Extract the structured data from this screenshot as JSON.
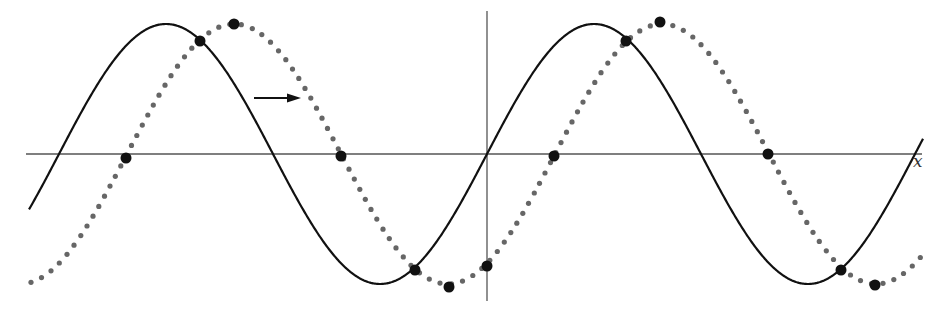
{
  "diagram": {
    "title": "",
    "x_axis_label": "x",
    "colors": {
      "solid_curve": "#111111",
      "dotted_curve": "#666666",
      "marker": "#111111",
      "axis": "#555555",
      "arrow": "#111111"
    },
    "geometry": {
      "origin": [
        487,
        154
      ],
      "amplitude_px": 130,
      "period_px": 428,
      "shift_px": 68,
      "x_axis": {
        "x1": 26,
        "x2": 922,
        "y": 154
      },
      "y_axis": {
        "x": 487,
        "y1": 11,
        "y2": 301
      },
      "solid_range": [
        29,
        923
      ],
      "dotted_range": [
        31,
        922
      ],
      "arrow": {
        "x1": 254,
        "x2": 301,
        "y": 98,
        "direction": "right"
      }
    },
    "curves": [
      {
        "name": "original-wave",
        "style": "solid",
        "equation": "y = sin(x)"
      },
      {
        "name": "shifted-wave",
        "style": "dotted",
        "equation": "y = sin(x - c)"
      }
    ],
    "markers": [
      [
        126,
        158
      ],
      [
        200,
        41
      ],
      [
        234,
        24
      ],
      [
        341,
        156
      ],
      [
        415,
        270
      ],
      [
        449,
        287
      ],
      [
        487,
        266
      ],
      [
        554,
        156
      ],
      [
        626,
        41
      ],
      [
        660,
        22
      ],
      [
        768,
        154
      ],
      [
        841,
        270
      ],
      [
        875,
        285
      ]
    ]
  }
}
